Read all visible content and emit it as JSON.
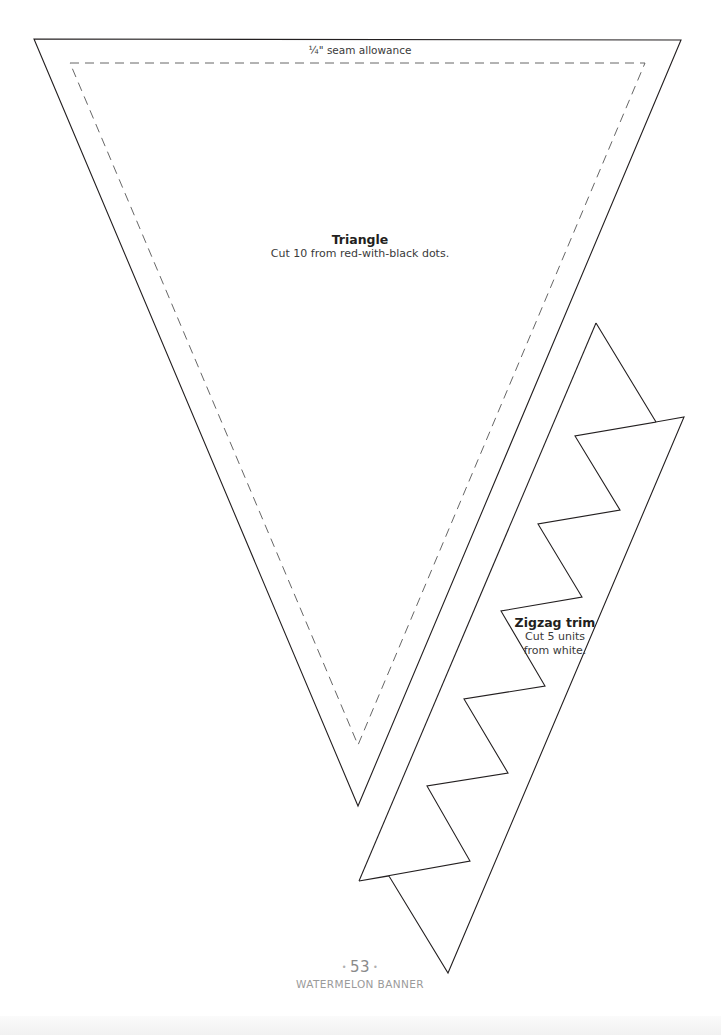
{
  "pattern": {
    "seam_allowance_label": "¼\" seam allowance",
    "triangle": {
      "title": "Triangle",
      "instruction": "Cut 10 from red-with-black dots."
    },
    "zigzag_trim": {
      "title": "Zigzag trim",
      "instruction_line1": "Cut 5 units",
      "instruction_line2": "from white."
    }
  },
  "footer": {
    "page_number": "53",
    "separator": "•",
    "section_title": "WATERMELON BANNER"
  },
  "colors": {
    "line": "#231f20",
    "text_muted": "#8a8a8a"
  }
}
